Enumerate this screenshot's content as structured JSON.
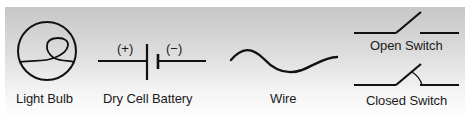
{
  "diagram": {
    "background": {
      "top_color": "#c7c7c7",
      "bottom_color": "#ffffff"
    },
    "stroke_color": "#111111",
    "symbols": [
      {
        "id": "light-bulb",
        "label": "Light Bulb"
      },
      {
        "id": "dry-cell-battery",
        "label": "Dry Cell Battery",
        "positive_label": "(+)",
        "negative_label": "(−)"
      },
      {
        "id": "wire",
        "label": "Wire"
      },
      {
        "id": "open-switch",
        "label": "Open Switch"
      },
      {
        "id": "closed-switch",
        "label": "Closed Switch"
      }
    ]
  }
}
